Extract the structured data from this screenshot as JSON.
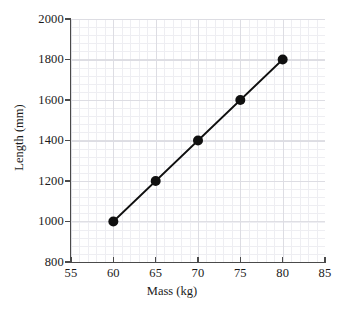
{
  "chart_data": {
    "type": "line",
    "title": "",
    "subtitle": "",
    "xlabel": "Mass (kg)",
    "ylabel": "Length (mm)",
    "xlim": [
      55,
      85
    ],
    "ylim": [
      800,
      2000
    ],
    "x": [
      60,
      65,
      70,
      75,
      80
    ],
    "values": [
      1000,
      1200,
      1400,
      1600,
      1800
    ],
    "series": [
      {
        "name": "",
        "x": [
          60,
          65,
          70,
          75,
          80
        ],
        "values": [
          1000,
          1200,
          1400,
          1600,
          1800
        ]
      }
    ],
    "points": [
      {
        "x": 60,
        "y": 1000
      },
      {
        "x": 65,
        "y": 1200
      },
      {
        "x": 70,
        "y": 1400
      },
      {
        "x": 75,
        "y": 1600
      },
      {
        "x": 80,
        "y": 1800
      }
    ],
    "x_ticks": [
      55,
      60,
      65,
      70,
      75,
      80,
      85
    ],
    "y_ticks": [
      800,
      1000,
      1200,
      1400,
      1600,
      1800,
      2000
    ],
    "x_tick_labels": [
      "55",
      "60",
      "65",
      "70",
      "75",
      "80",
      "85"
    ],
    "y_tick_labels": [
      "800",
      "1000",
      "1200",
      "1400",
      "1600",
      "1800",
      "2000"
    ],
    "grid": true,
    "grid_minor": true,
    "legend": false,
    "legend_position": "none",
    "annotations": [],
    "colors": {
      "line": "#101010",
      "marker": "#101010",
      "axis": "#4a4a4a",
      "grid_major": "#dcdce2",
      "grid_minor": "#ececf0",
      "background": "#ffffff",
      "text": "#1a1a1a"
    },
    "marker": "circle",
    "marker_size": 5,
    "line_width": 1.8
  }
}
